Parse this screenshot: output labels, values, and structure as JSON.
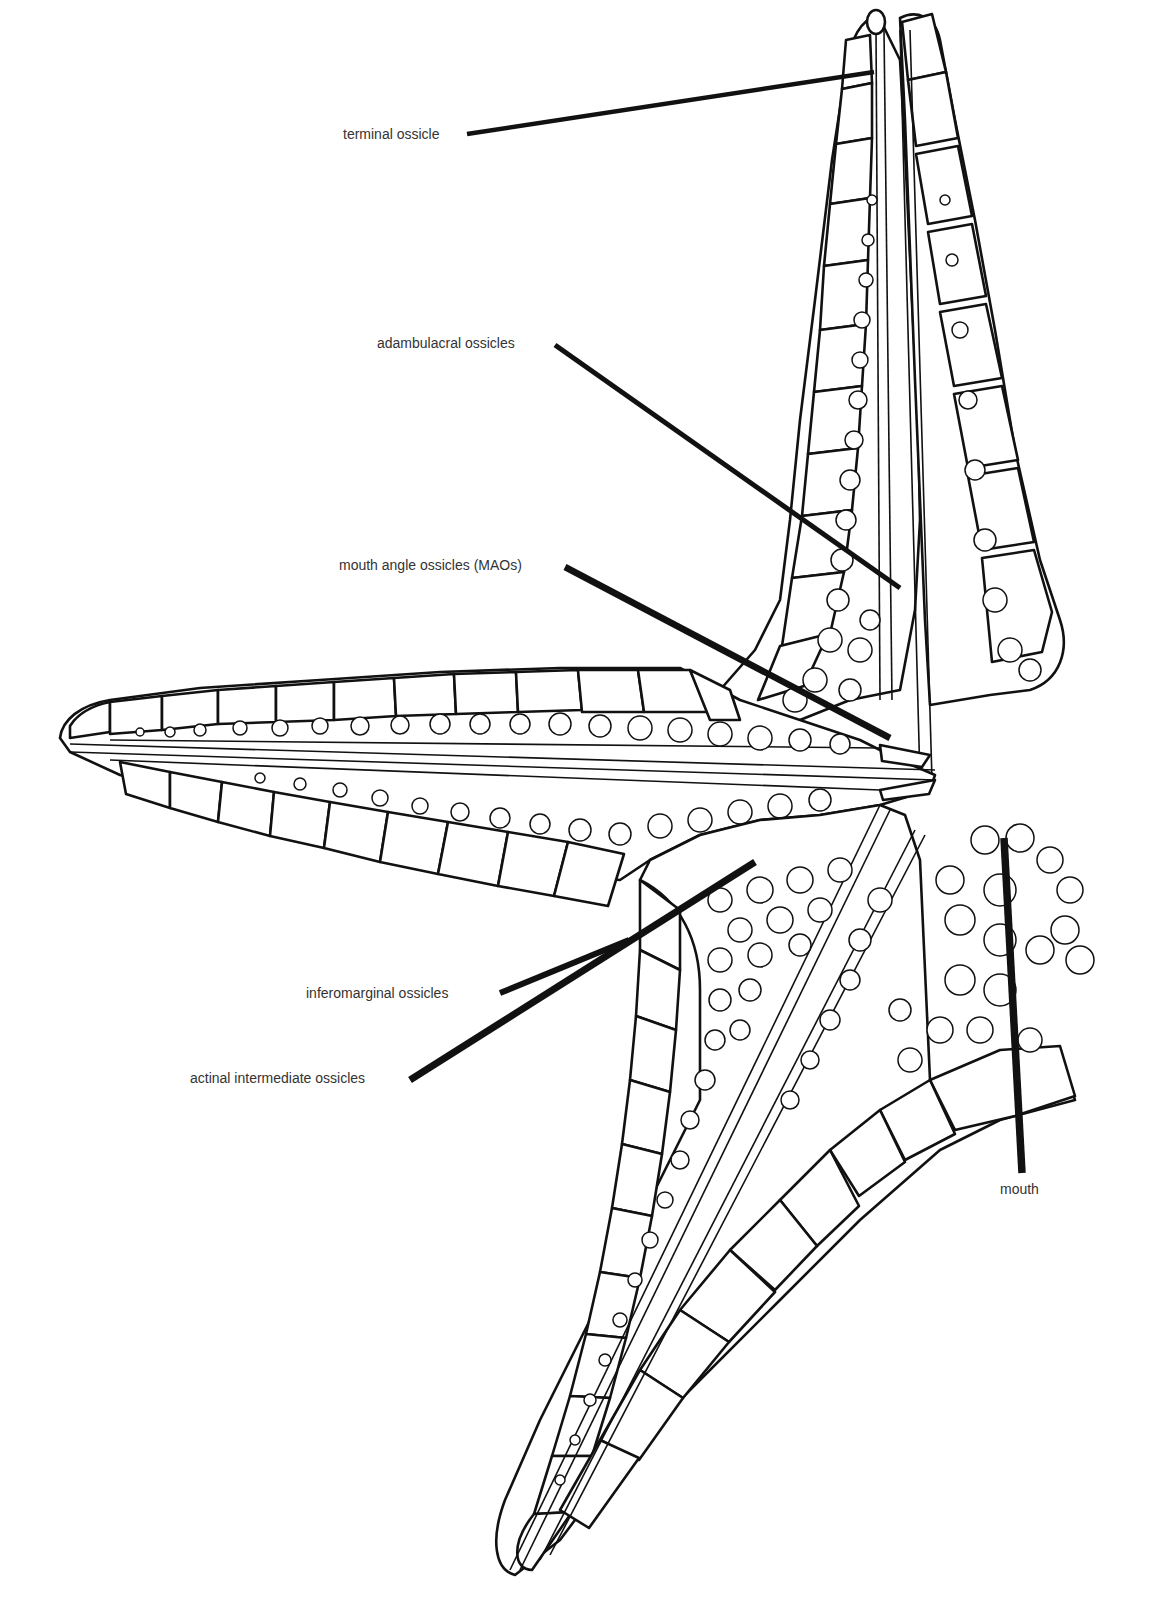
{
  "figure": {
    "labels": [
      {
        "id": "terminal",
        "text": "terminal ossicle"
      },
      {
        "id": "adambulacral",
        "text": "adambulacral ossicles"
      },
      {
        "id": "mao",
        "text": "mouth angle ossicles (MAOs)"
      },
      {
        "id": "inferomarginal",
        "text": "inferomarginal ossicles"
      },
      {
        "id": "actinal",
        "text": "actinal intermediate ossicles"
      },
      {
        "id": "mouth",
        "text": "mouth"
      }
    ],
    "colors": {
      "ink": "#111111",
      "label": "#333333",
      "background": "#ffffff"
    }
  }
}
